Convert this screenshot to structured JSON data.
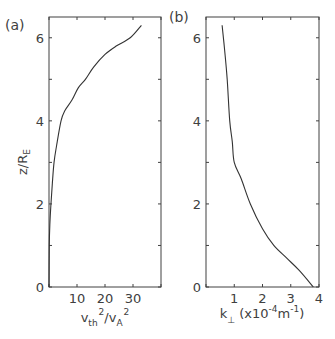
{
  "chart_data": [
    {
      "type": "line",
      "panel_label": "(a)",
      "title": "",
      "xlabel": {
        "base": "v",
        "sub": "th",
        "sup": "2",
        "slash": "/",
        "base2": "v",
        "sub2": "A",
        "sup2": "2"
      },
      "ylabel": {
        "base": "z/R",
        "sub": "E"
      },
      "xlim": [
        0,
        40
      ],
      "ylim": [
        0,
        6.5
      ],
      "xticks": [
        0,
        10,
        20,
        30,
        40
      ],
      "xtick_labels": [
        "",
        "10",
        "20",
        "30",
        ""
      ],
      "yticks": [
        0,
        1,
        2,
        3,
        4,
        5,
        6
      ],
      "ytick_labels": [
        "0",
        "",
        "2",
        "",
        "4",
        "",
        "6"
      ],
      "grid": false,
      "series": [
        {
          "name": "vth2_over_vA2",
          "x": [
            0.0,
            0.1,
            0.3,
            0.7,
            1.2,
            1.8,
            2.7,
            4.3,
            5.7,
            8.2,
            10.5,
            13.0,
            16.0,
            20.0,
            24.0,
            29.0,
            33.0
          ],
          "y": [
            0.0,
            1.0,
            1.5,
            2.0,
            2.5,
            3.0,
            3.4,
            4.0,
            4.25,
            4.5,
            4.8,
            5.0,
            5.3,
            5.6,
            5.8,
            6.0,
            6.3
          ]
        }
      ]
    },
    {
      "type": "line",
      "panel_label": "(b)",
      "title": "",
      "xlabel": {
        "base": "k",
        "sub": "⊥",
        "rest": " (x10",
        "sup": "-4",
        "unit": "m",
        "sup2": "-1",
        "close": ")"
      },
      "ylabel": "",
      "xlim": [
        0,
        4
      ],
      "ylim": [
        0,
        6.5
      ],
      "xticks": [
        0,
        1,
        2,
        3,
        4
      ],
      "xtick_labels": [
        "",
        "1",
        "2",
        "3",
        "4"
      ],
      "yticks": [
        0,
        1,
        2,
        3,
        4,
        5,
        6
      ],
      "ytick_labels": [
        "0",
        "",
        "2",
        "",
        "4",
        "",
        "6"
      ],
      "grid": false,
      "series": [
        {
          "name": "k_perp",
          "x": [
            3.8,
            3.3,
            2.85,
            2.4,
            2.0,
            1.57,
            1.25,
            1.0,
            0.93,
            0.84,
            0.75,
            0.66,
            0.57
          ],
          "y": [
            0.0,
            0.4,
            0.7,
            1.0,
            1.4,
            2.0,
            2.6,
            3.0,
            3.5,
            4.0,
            5.0,
            5.7,
            6.3
          ]
        }
      ]
    }
  ]
}
